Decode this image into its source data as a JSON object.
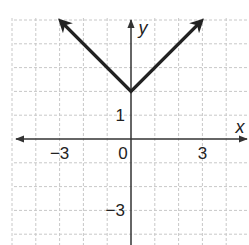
{
  "chart_data": {
    "type": "line",
    "title": "",
    "function": "y = |x| + 2",
    "xlabel": "x",
    "ylabel": "y",
    "xlim": [
      -5.1,
      5
    ],
    "ylim": [
      -4.4,
      5
    ],
    "grid": true,
    "grid_style": "dashed",
    "x_ticks": [
      {
        "value": -3,
        "label": "−3"
      },
      {
        "value": 0,
        "label": "0"
      },
      {
        "value": 3,
        "label": "3"
      }
    ],
    "y_ticks": [
      {
        "value": 1,
        "label": "1"
      },
      {
        "value": -3,
        "label": "−3"
      }
    ],
    "series": [
      {
        "name": "V graph",
        "x": [
          -2.9,
          0,
          2.9
        ],
        "y": [
          4.9,
          2,
          4.9
        ],
        "arrows": "both ends"
      }
    ],
    "vertex": [
      0,
      2
    ]
  },
  "colors": {
    "curve": "#222222",
    "axis": "#333333",
    "grid": "#c8c8c8"
  }
}
